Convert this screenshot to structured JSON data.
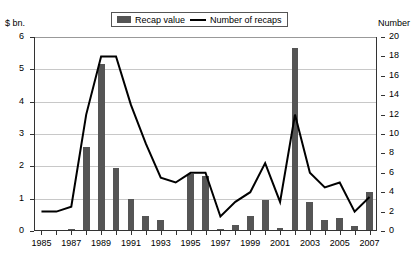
{
  "legend": {
    "items": [
      {
        "label": "Recap value",
        "marker": "bar-swatch",
        "color": "#555555"
      },
      {
        "label": "Number of recaps",
        "marker": "line-swatch",
        "color": "#000000"
      }
    ]
  },
  "axes": {
    "left_title": "$ bn.",
    "right_title": "Number",
    "left_ticks": [
      "0",
      "1",
      "2",
      "3",
      "4",
      "5",
      "6"
    ],
    "right_ticks": [
      "0",
      "2",
      "4",
      "6",
      "8",
      "10",
      "12",
      "14",
      "16",
      "18",
      "20"
    ],
    "x_labels": [
      "1985",
      "1987",
      "1989",
      "1991",
      "1993",
      "1995",
      "1997",
      "1999",
      "2001",
      "2003",
      "2005",
      "2007"
    ]
  },
  "chart_data": {
    "type": "bar",
    "title": "",
    "xlabel": "",
    "ylabel": "$ bn.",
    "y2label": "Number",
    "ylim": [
      0,
      6
    ],
    "y2lim": [
      0,
      20
    ],
    "grid": true,
    "legend_position": "top-center",
    "categories": [
      "1985",
      "1986",
      "1987",
      "1988",
      "1989",
      "1990",
      "1991",
      "1992",
      "1993",
      "1994",
      "1995",
      "1996",
      "1997",
      "1998",
      "1999",
      "2000",
      "2001",
      "2002",
      "2003",
      "2004",
      "2005",
      "2006",
      "2007"
    ],
    "series": [
      {
        "name": "Recap value",
        "type": "bar",
        "axis": "left",
        "unit": "$ bn.",
        "color": "#555555",
        "values": [
          0,
          0,
          0.05,
          2.6,
          5.15,
          1.95,
          1.0,
          0.45,
          0.35,
          0,
          1.75,
          1.7,
          0.05,
          0.2,
          0.45,
          0.95,
          0.1,
          5.65,
          0.9,
          0.35,
          0.4,
          0.15,
          1.2
        ]
      },
      {
        "name": "Number of recaps",
        "type": "line",
        "axis": "right",
        "unit": "Number",
        "color": "#000000",
        "values": [
          2,
          2,
          2.5,
          12,
          18,
          18,
          13,
          9,
          5.5,
          5,
          6,
          6,
          1.5,
          3,
          4,
          7,
          3,
          12,
          6,
          4.5,
          5,
          2,
          3.5
        ]
      }
    ]
  }
}
